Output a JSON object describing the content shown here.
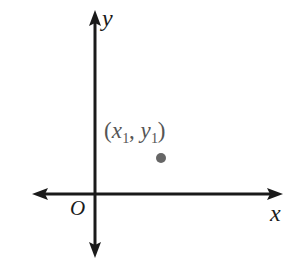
{
  "figure": {
    "type": "coordinate-plane-diagram",
    "background_color": "#ffffff",
    "axis_color": "#1a1a1a",
    "label_color": "#1a1a1a",
    "point_color": "#666666",
    "point_label_color": "#555555"
  },
  "axes": {
    "x_label": "x",
    "y_label": "y",
    "origin_label": "O",
    "x_axis": {
      "y_position": 194,
      "x_start": 32,
      "x_end": 283,
      "arrow_start": true,
      "arrow_end": true
    },
    "y_axis": {
      "x_position": 95,
      "y_start": 10,
      "y_end": 258,
      "arrow_start": true,
      "arrow_end": true
    }
  },
  "point": {
    "label_parts": {
      "open_paren": "(",
      "x_var": "x",
      "x_sub": "1",
      "comma": ", ",
      "y_var": "y",
      "y_sub": "1",
      "close_paren": ")"
    },
    "label_text": "(x1, y1)",
    "center_x": 161,
    "center_y": 158,
    "radius": 5,
    "quadrant": 1
  }
}
